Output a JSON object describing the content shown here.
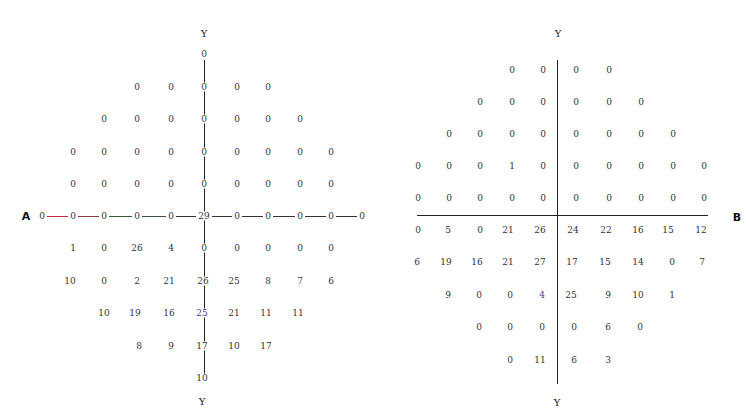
{
  "chart_data": [
    {
      "type": "table",
      "title": "Panel A (left) – grid of threshold values along horizontal meridian A and vertical meridian Y",
      "axis_labels": {
        "top": "Y",
        "bottom": "Y",
        "left": "A"
      },
      "layout": "points arranged on grid; rows listed top to bottom, columns left to right",
      "rows": [
        {
          "y": 54,
          "cells": [
            {
              "x": 204,
              "v": "0"
            }
          ]
        },
        {
          "y": 87,
          "cells": [
            {
              "x": 137,
              "v": "0"
            },
            {
              "x": 171,
              "v": "0"
            },
            {
              "x": 204,
              "v": "0"
            },
            {
              "x": 237,
              "v": "0"
            },
            {
              "x": 268,
              "v": "0"
            }
          ]
        },
        {
          "y": 119,
          "cells": [
            {
              "x": 104,
              "v": "0"
            },
            {
              "x": 137,
              "v": "0"
            },
            {
              "x": 171,
              "v": "0"
            },
            {
              "x": 204,
              "v": "0"
            },
            {
              "x": 237,
              "v": "0"
            },
            {
              "x": 268,
              "v": "0"
            },
            {
              "x": 300,
              "v": "0"
            }
          ]
        },
        {
          "y": 152,
          "cells": [
            {
              "x": 73,
              "v": "0"
            },
            {
              "x": 104,
              "v": "0"
            },
            {
              "x": 137,
              "v": "0"
            },
            {
              "x": 171,
              "v": "0"
            },
            {
              "x": 204,
              "v": "0"
            },
            {
              "x": 237,
              "v": "0"
            },
            {
              "x": 268,
              "v": "0"
            },
            {
              "x": 300,
              "v": "0"
            },
            {
              "x": 331,
              "v": "0"
            }
          ]
        },
        {
          "y": 184,
          "cells": [
            {
              "x": 73,
              "v": "0"
            },
            {
              "x": 104,
              "v": "0"
            },
            {
              "x": 137,
              "v": "0"
            },
            {
              "x": 171,
              "v": "0"
            },
            {
              "x": 204,
              "v": "0"
            },
            {
              "x": 237,
              "v": "0"
            },
            {
              "x": 268,
              "v": "0"
            },
            {
              "x": 300,
              "v": "0"
            },
            {
              "x": 331,
              "v": "0"
            }
          ]
        },
        {
          "y": 216,
          "cells": [
            {
              "x": 42,
              "v": "0"
            },
            {
              "x": 73,
              "v": "0"
            },
            {
              "x": 104,
              "v": "0"
            },
            {
              "x": 137,
              "v": "0"
            },
            {
              "x": 171,
              "v": "0"
            },
            {
              "x": 204,
              "v": "29"
            },
            {
              "x": 237,
              "v": "0"
            },
            {
              "x": 268,
              "v": "0"
            },
            {
              "x": 300,
              "v": "0"
            },
            {
              "x": 331,
              "v": "0"
            },
            {
              "x": 362,
              "v": "0"
            }
          ]
        },
        {
          "y": 248,
          "cells": [
            {
              "x": 73,
              "v": "1"
            },
            {
              "x": 104,
              "v": "0"
            },
            {
              "x": 137,
              "v": "26"
            },
            {
              "x": 171,
              "v": "4"
            },
            {
              "x": 204,
              "v": "0"
            },
            {
              "x": 237,
              "v": "0"
            },
            {
              "x": 268,
              "v": "0"
            },
            {
              "x": 300,
              "v": "0"
            },
            {
              "x": 331,
              "v": "0"
            }
          ]
        },
        {
          "y": 281,
          "cells": [
            {
              "x": 70,
              "v": "10"
            },
            {
              "x": 104,
              "v": "0"
            },
            {
              "x": 137,
              "v": "2"
            },
            {
              "x": 169,
              "v": "21"
            },
            {
              "x": 203,
              "v": "26"
            },
            {
              "x": 234,
              "v": "25"
            },
            {
              "x": 268,
              "v": "8"
            },
            {
              "x": 300,
              "v": "7",
              "color": "blue"
            },
            {
              "x": 331,
              "v": "6"
            }
          ]
        },
        {
          "y": 313,
          "cells": [
            {
              "x": 104,
              "v": "10"
            },
            {
              "x": 135,
              "v": "19"
            },
            {
              "x": 169,
              "v": "16"
            },
            {
              "x": 202,
              "v": "25",
              "color": "blue"
            },
            {
              "x": 234,
              "v": "21"
            },
            {
              "x": 266,
              "v": "11"
            },
            {
              "x": 298,
              "v": "11"
            }
          ]
        },
        {
          "y": 346,
          "cells": [
            {
              "x": 139,
              "v": "8"
            },
            {
              "x": 171,
              "v": "9"
            },
            {
              "x": 202,
              "v": "17"
            },
            {
              "x": 234,
              "v": "10"
            },
            {
              "x": 266,
              "v": "17"
            }
          ]
        },
        {
          "y": 378,
          "cells": [
            {
              "x": 202,
              "v": "10"
            }
          ]
        }
      ]
    },
    {
      "type": "table",
      "title": "Panel B (right) – grid of threshold values in four quadrants split by horizontal meridian B and vertical meridian Y",
      "axis_labels": {
        "top": "Y",
        "bottom": "Y",
        "right": "B"
      },
      "layout": "points arranged on grid; rows listed top to bottom, columns left to right",
      "rows": [
        {
          "y": 70,
          "cells": [
            {
              "x": 512,
              "v": "0"
            },
            {
              "x": 543,
              "v": "0"
            },
            {
              "x": 576,
              "v": "0"
            },
            {
              "x": 609,
              "v": "0"
            }
          ]
        },
        {
          "y": 102,
          "cells": [
            {
              "x": 480,
              "v": "0"
            },
            {
              "x": 512,
              "v": "0"
            },
            {
              "x": 543,
              "v": "0"
            },
            {
              "x": 576,
              "v": "0"
            },
            {
              "x": 609,
              "v": "0"
            },
            {
              "x": 641,
              "v": "0"
            }
          ]
        },
        {
          "y": 134,
          "cells": [
            {
              "x": 449,
              "v": "0"
            },
            {
              "x": 480,
              "v": "0"
            },
            {
              "x": 512,
              "v": "0"
            },
            {
              "x": 543,
              "v": "0"
            },
            {
              "x": 576,
              "v": "0"
            },
            {
              "x": 609,
              "v": "0"
            },
            {
              "x": 641,
              "v": "0"
            },
            {
              "x": 673,
              "v": "0"
            }
          ]
        },
        {
          "y": 166,
          "cells": [
            {
              "x": 418,
              "v": "0"
            },
            {
              "x": 449,
              "v": "0"
            },
            {
              "x": 480,
              "v": "0"
            },
            {
              "x": 512,
              "v": "1"
            },
            {
              "x": 543,
              "v": "0"
            },
            {
              "x": 576,
              "v": "0"
            },
            {
              "x": 609,
              "v": "0"
            },
            {
              "x": 641,
              "v": "0"
            },
            {
              "x": 673,
              "v": "0"
            },
            {
              "x": 704,
              "v": "0"
            }
          ]
        },
        {
          "y": 198,
          "cells": [
            {
              "x": 418,
              "v": "0"
            },
            {
              "x": 449,
              "v": "0"
            },
            {
              "x": 480,
              "v": "0"
            },
            {
              "x": 512,
              "v": "0"
            },
            {
              "x": 543,
              "v": "0"
            },
            {
              "x": 576,
              "v": "0"
            },
            {
              "x": 609,
              "v": "0"
            },
            {
              "x": 641,
              "v": "0"
            },
            {
              "x": 673,
              "v": "0"
            },
            {
              "x": 704,
              "v": "0"
            }
          ]
        },
        {
          "y": 230,
          "cells": [
            {
              "x": 418,
              "v": "0"
            },
            {
              "x": 448,
              "v": "5"
            },
            {
              "x": 480,
              "v": "0"
            },
            {
              "x": 508,
              "v": "21"
            },
            {
              "x": 540,
              "v": "26"
            },
            {
              "x": 573,
              "v": "24"
            },
            {
              "x": 606,
              "v": "22"
            },
            {
              "x": 638,
              "v": "16"
            },
            {
              "x": 668,
              "v": "15"
            },
            {
              "x": 701,
              "v": "12"
            }
          ]
        },
        {
          "y": 262,
          "cells": [
            {
              "x": 417,
              "v": "6"
            },
            {
              "x": 446,
              "v": "19"
            },
            {
              "x": 477,
              "v": "16"
            },
            {
              "x": 508,
              "v": "21"
            },
            {
              "x": 540,
              "v": "27"
            },
            {
              "x": 572,
              "v": "17"
            },
            {
              "x": 605,
              "v": "15"
            },
            {
              "x": 638,
              "v": "14"
            },
            {
              "x": 672,
              "v": "0"
            },
            {
              "x": 702,
              "v": "7"
            }
          ]
        },
        {
          "y": 295,
          "cells": [
            {
              "x": 448,
              "v": "9"
            },
            {
              "x": 479,
              "v": "0"
            },
            {
              "x": 510,
              "v": "0"
            },
            {
              "x": 542,
              "v": "4",
              "color": "blue"
            },
            {
              "x": 571,
              "v": "25"
            },
            {
              "x": 608,
              "v": "9"
            },
            {
              "x": 638,
              "v": "10"
            },
            {
              "x": 672,
              "v": "1"
            }
          ]
        },
        {
          "y": 327,
          "cells": [
            {
              "x": 479,
              "v": "0"
            },
            {
              "x": 510,
              "v": "0"
            },
            {
              "x": 542,
              "v": "0"
            },
            {
              "x": 574,
              "v": "0"
            },
            {
              "x": 608,
              "v": "6"
            },
            {
              "x": 640,
              "v": "0"
            }
          ]
        },
        {
          "y": 360,
          "cells": [
            {
              "x": 510,
              "v": "0"
            },
            {
              "x": 540,
              "v": "11"
            },
            {
              "x": 574,
              "v": "6"
            },
            {
              "x": 608,
              "v": "3"
            }
          ]
        }
      ]
    }
  ],
  "labels": {
    "left_top_y": "Y",
    "left_bottom_y": "Y",
    "left_a": "A",
    "right_top_y": "Y",
    "right_bottom_y": "Y",
    "right_b": "B"
  },
  "colors": {
    "text": "#333333",
    "blue_value": "#3a3f8f",
    "axis": "#222222",
    "a_line_red": "#c0303a",
    "a_line_green": "#2e5f3a",
    "a_line_dark": "#333333"
  }
}
